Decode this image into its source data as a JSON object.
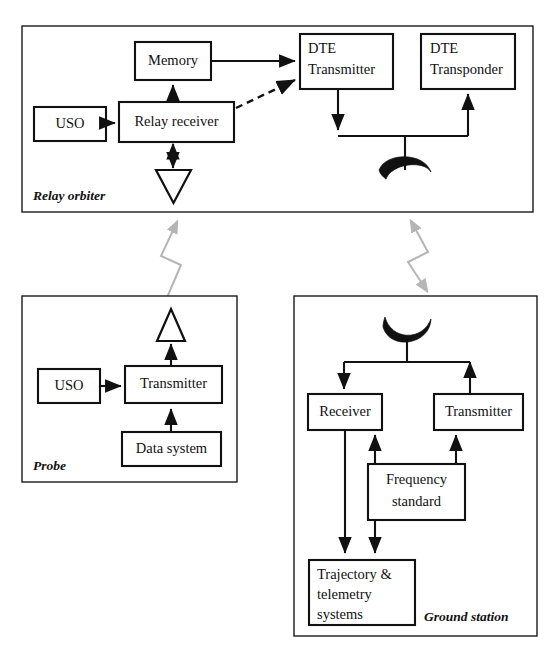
{
  "diagram": {
    "panels": [
      {
        "id": "relay-orbiter",
        "label": "Relay orbiter",
        "nodes": [
          {
            "id": "uso-orbiter",
            "label": "USO"
          },
          {
            "id": "relay-receiver",
            "label": "Relay receiver"
          },
          {
            "id": "memory",
            "label": "Memory"
          },
          {
            "id": "dte-transmitter",
            "label_line1": "DTE",
            "label_line2": "Transmitter"
          },
          {
            "id": "dte-transponder",
            "label_line1": "DTE",
            "label_line2": "Transponder"
          }
        ],
        "antennas": [
          {
            "id": "orbiter-relay-antenna",
            "kind": "triangle-down"
          },
          {
            "id": "orbiter-dte-dish",
            "kind": "dish-down"
          }
        ]
      },
      {
        "id": "probe",
        "label": "Probe",
        "nodes": [
          {
            "id": "uso-probe",
            "label": "USO"
          },
          {
            "id": "probe-transmitter",
            "label": "Transmitter"
          },
          {
            "id": "data-system",
            "label": "Data system"
          }
        ],
        "antennas": [
          {
            "id": "probe-antenna",
            "kind": "triangle-up"
          }
        ]
      },
      {
        "id": "ground-station",
        "label": "Ground station",
        "nodes": [
          {
            "id": "ground-receiver",
            "label": "Receiver"
          },
          {
            "id": "ground-transmitter",
            "label": "Transmitter"
          },
          {
            "id": "frequency-standard",
            "label_line1": "Frequency",
            "label_line2": "standard"
          },
          {
            "id": "trajectory-telemetry",
            "label_line1": "Trajectory &",
            "label_line2": "telemetry",
            "label_line3": "systems"
          }
        ],
        "antennas": [
          {
            "id": "ground-dish",
            "kind": "dish-up"
          }
        ]
      }
    ],
    "links": [
      {
        "id": "uso-to-relay-receiver",
        "style": "solid"
      },
      {
        "id": "relay-receiver-to-memory",
        "style": "solid"
      },
      {
        "id": "memory-to-dte-transmitter",
        "style": "solid"
      },
      {
        "id": "relay-receiver-to-dte-transmitter",
        "style": "dashed"
      },
      {
        "id": "relay-receiver-to-antenna",
        "style": "solid-bidirectional"
      },
      {
        "id": "dte-transmitter-to-bus",
        "style": "solid"
      },
      {
        "id": "bus-to-dte-transponder",
        "style": "solid"
      },
      {
        "id": "bus-to-orbiter-dish",
        "style": "solid"
      },
      {
        "id": "uso-to-probe-transmitter",
        "style": "solid"
      },
      {
        "id": "data-system-to-probe-transmitter",
        "style": "solid"
      },
      {
        "id": "probe-transmitter-to-antenna",
        "style": "solid"
      },
      {
        "id": "ground-dish-to-receiver",
        "style": "solid"
      },
      {
        "id": "ground-transmitter-to-dish",
        "style": "solid"
      },
      {
        "id": "frequency-standard-to-receiver",
        "style": "solid"
      },
      {
        "id": "frequency-standard-to-transmitter",
        "style": "solid"
      },
      {
        "id": "frequency-standard-to-trajectory",
        "style": "solid"
      },
      {
        "id": "receiver-to-trajectory",
        "style": "solid"
      }
    ],
    "wave_links": [
      {
        "id": "probe-to-orbiter-wave",
        "direction": "up",
        "color": "#b5b5b5"
      },
      {
        "id": "orbiter-to-ground-wave",
        "direction": "bidirectional",
        "color": "#b5b5b5"
      }
    ],
    "colors": {
      "line": "#111111",
      "panel_border": "#1a1a1a",
      "wave": "#b5b5b5",
      "background": "#ffffff"
    }
  }
}
